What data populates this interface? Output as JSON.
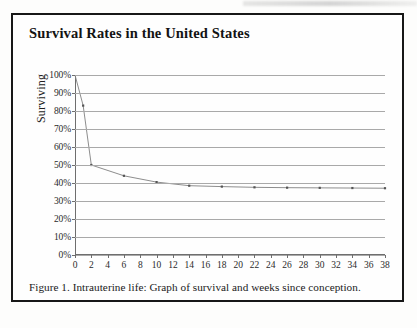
{
  "figure": {
    "title": "Survival Rates in the United States",
    "caption": "Figure 1. Intrauterine life: Graph of survival and weeks since conception."
  },
  "chart_data": {
    "type": "line",
    "title": "Survival Rates in the United States",
    "xlabel": "",
    "ylabel": "Surviving",
    "xlim": [
      0,
      38
    ],
    "ylim": [
      0,
      100
    ],
    "grid": true,
    "legend": "none",
    "marker": "square",
    "line_color": "#808080",
    "marker_color": "#555555",
    "grid_color": "#a9a9a9",
    "x_tick_labels": [
      "0",
      "2",
      "4",
      "6",
      "8",
      "10",
      "12",
      "14",
      "16",
      "18",
      "20",
      "22",
      "24",
      "26",
      "28",
      "30",
      "32",
      "34",
      "36",
      "38"
    ],
    "x_tick_values": [
      0,
      2,
      4,
      6,
      8,
      10,
      12,
      14,
      16,
      18,
      20,
      22,
      24,
      26,
      28,
      30,
      32,
      34,
      36,
      38
    ],
    "y_tick_labels": [
      "0%",
      "10%",
      "20%",
      "30%",
      "40%",
      "50%",
      "60%",
      "70%",
      "80%",
      "90%",
      "100%"
    ],
    "y_tick_values": [
      0,
      10,
      20,
      30,
      40,
      50,
      60,
      70,
      80,
      90,
      100
    ],
    "x": [
      0,
      1,
      2,
      6,
      10,
      14,
      18,
      22,
      26,
      30,
      34,
      38
    ],
    "values": [
      100,
      83,
      50,
      44,
      40.5,
      38.5,
      38,
      37.6,
      37.4,
      37.3,
      37.2,
      37.1
    ]
  }
}
